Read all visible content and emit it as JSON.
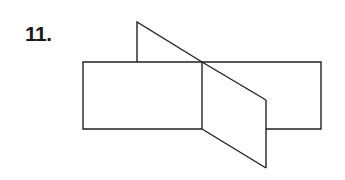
{
  "problem": {
    "number_label": "11."
  },
  "figure": {
    "stroke_color": "#222222",
    "background": "#ffffff"
  }
}
